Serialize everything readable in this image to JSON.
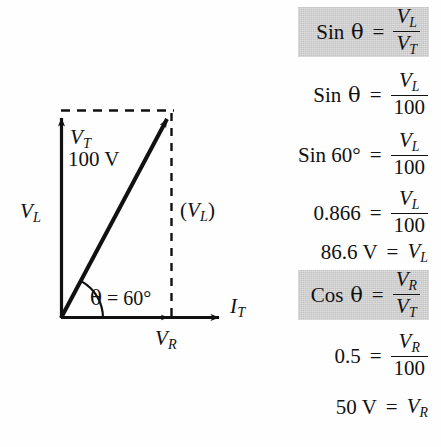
{
  "figure": {
    "type": "phasor-diagram",
    "title_present": false,
    "background_color": "#fefefe",
    "ink_color": "#111111",
    "highlight_color": "#c3c3c3",
    "geometry": {
      "origin": [
        61,
        318
      ],
      "vl_axis_tip": [
        61,
        110
      ],
      "it_axis_tip": [
        228,
        318
      ],
      "vt_vector_tip": [
        172,
        112
      ],
      "vr_tick": [
        172,
        318
      ],
      "dashed_top_line": [
        [
          61,
          110
        ],
        [
          172,
          110
        ]
      ],
      "dashed_right_line": [
        [
          172,
          112
        ],
        [
          172,
          318
        ]
      ],
      "angle_arc_radius": 42,
      "angle_degrees": 60
    },
    "labels": {
      "vt": "V",
      "vt_sub": "T",
      "vt_magnitude": "100 V",
      "vl_axis": "V",
      "vl_axis_sub": "L",
      "vl_parallel_open": "(",
      "vl_parallel": "V",
      "vl_parallel_sub": "L",
      "vl_parallel_close": ")",
      "theta": "θ",
      "theta_equals": " = 60°",
      "vr": "V",
      "vr_sub": "R",
      "it": "I",
      "it_sub": "T"
    }
  },
  "equations": [
    {
      "id": "sin-theta-definition",
      "highlighted": true,
      "lhs_main": "Sin",
      "lhs_symbol": "θ",
      "equals": "=",
      "rhs_type": "fraction",
      "numerator_main": "V",
      "numerator_sub": "L",
      "denominator_main": "V",
      "denominator_sub": "T",
      "top": 7,
      "height": 50
    },
    {
      "id": "sin-theta-over-100",
      "highlighted": false,
      "lhs_main": "Sin",
      "lhs_symbol": "θ",
      "equals": "=",
      "rhs_type": "fraction",
      "numerator_main": "V",
      "numerator_sub": "L",
      "denominator_main": "100",
      "denominator_sub": "",
      "top": 70,
      "height": 50
    },
    {
      "id": "sin-60-over-100",
      "highlighted": false,
      "lhs_main": "Sin 60°",
      "lhs_symbol": "",
      "equals": "=",
      "rhs_type": "fraction",
      "numerator_main": "V",
      "numerator_sub": "L",
      "denominator_main": "100",
      "denominator_sub": "",
      "top": 130,
      "height": 50
    },
    {
      "id": "point866-over-100",
      "highlighted": false,
      "lhs_main": "0.866",
      "lhs_symbol": "",
      "equals": "=",
      "rhs_type": "fraction",
      "numerator_main": "V",
      "numerator_sub": "L",
      "denominator_main": "100",
      "denominator_sub": "",
      "top": 188,
      "height": 50
    },
    {
      "id": "vl-result",
      "highlighted": false,
      "lhs_main": "86.6 V",
      "lhs_symbol": "",
      "equals": "=",
      "rhs_type": "symbol",
      "numerator_main": "V",
      "numerator_sub": "L",
      "denominator_main": "",
      "denominator_sub": "",
      "top": 236,
      "height": 32
    },
    {
      "id": "cos-theta-definition",
      "highlighted": true,
      "lhs_main": "Cos",
      "lhs_symbol": "θ",
      "equals": "=",
      "rhs_type": "fraction",
      "numerator_main": "V",
      "numerator_sub": "R",
      "denominator_main": "V",
      "denominator_sub": "T",
      "top": 270,
      "height": 50
    },
    {
      "id": "point5-over-100",
      "highlighted": false,
      "lhs_main": "0.5",
      "lhs_symbol": "",
      "equals": "=",
      "rhs_type": "fraction",
      "numerator_main": "V",
      "numerator_sub": "R",
      "denominator_main": "100",
      "denominator_sub": "",
      "top": 331,
      "height": 50
    },
    {
      "id": "vr-result",
      "highlighted": false,
      "lhs_main": "50 V",
      "lhs_symbol": "",
      "equals": "=",
      "rhs_type": "symbol",
      "numerator_main": "V",
      "numerator_sub": "R",
      "denominator_main": "",
      "denominator_sub": "",
      "top": 391,
      "height": 32
    }
  ]
}
